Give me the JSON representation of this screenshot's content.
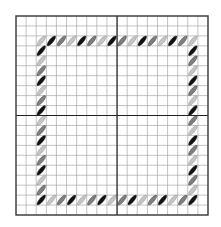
{
  "chart_data": {
    "type": "diagram",
    "title": "",
    "grid": {
      "left": 16,
      "top": 16,
      "right": 208,
      "bottom": 215,
      "cols": 19,
      "rows": 20,
      "center_col_line": 10,
      "center_row_line": 10,
      "line_color": "#9a9a9a",
      "center_line_color": "#222222",
      "border_color": "#333333"
    },
    "colors": {
      "light": "#c4c4c4",
      "mid": "#7e7e7e",
      "dark": "#111111"
    },
    "border_stitches": {
      "start_col": 2,
      "end_col": 17,
      "start_row": 2,
      "end_row": 18,
      "color_cycle": [
        "light",
        "dark",
        "mid"
      ]
    }
  }
}
